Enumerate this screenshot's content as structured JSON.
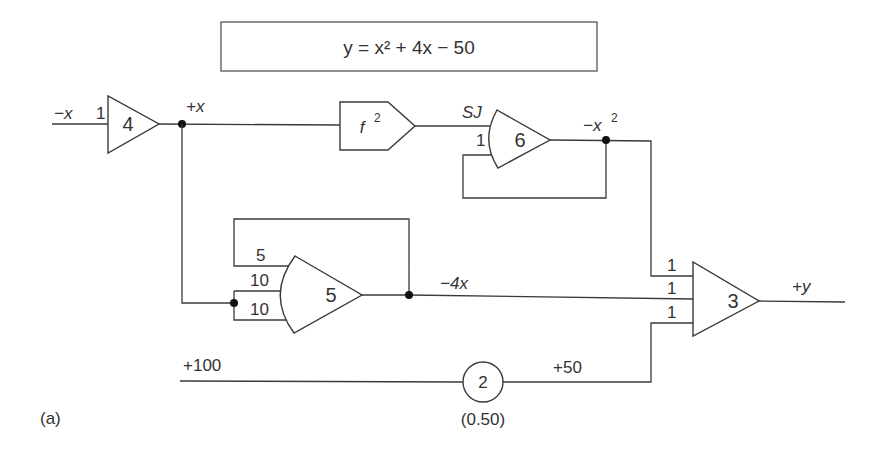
{
  "equation": {
    "text": "y = x² + 4x − 50"
  },
  "amplifiers": [
    {
      "id": "4",
      "label": "4",
      "input_gains": [
        "1"
      ],
      "type": "inverting-amplifier"
    },
    {
      "id": "6",
      "label": "6",
      "input_gains": [
        "1"
      ],
      "input_note": "SJ",
      "type": "summing-integrator"
    },
    {
      "id": "5",
      "label": "5",
      "input_gains": [
        "5",
        "10",
        "10"
      ],
      "type": "summer"
    },
    {
      "id": "3",
      "label": "3",
      "input_gains": [
        "1",
        "1",
        "1"
      ],
      "type": "summer"
    }
  ],
  "function_generator": {
    "label": "f",
    "exponent": "2"
  },
  "potentiometer": {
    "label": "2",
    "setting": "(0.50)"
  },
  "signals": {
    "input": "−x",
    "plus_x": "+x",
    "minus_x_sq": "−x",
    "minus_x_sq_exp": "2",
    "minus_4x": "−4x",
    "plus_y": "+y",
    "ref_100": "+100",
    "plus_50": "+50",
    "sj": "SJ"
  },
  "caption": "(a)"
}
